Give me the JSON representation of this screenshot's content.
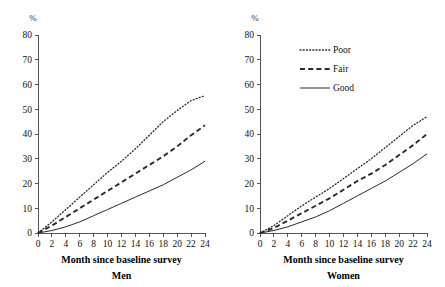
{
  "figure": {
    "width": 445,
    "height": 287,
    "background": "#ffffff",
    "line_color": "#2a2a2a",
    "axis_color": "#555555"
  },
  "legend": {
    "position": "top-right-of-women-panel",
    "entries": [
      {
        "label": "Poor",
        "style": "dotted"
      },
      {
        "label": "Fair",
        "style": "dashed"
      },
      {
        "label": "Good",
        "style": "solid"
      }
    ]
  },
  "chart_data": [
    {
      "type": "line",
      "title": "Men",
      "xlabel": "Month since baseline survey",
      "ylabel": "%",
      "unit": "%",
      "xlim": [
        0,
        24
      ],
      "ylim": [
        0,
        80
      ],
      "xticks": [
        0,
        2,
        4,
        6,
        8,
        10,
        12,
        14,
        16,
        18,
        20,
        22,
        24
      ],
      "yticks": [
        0,
        10,
        20,
        30,
        40,
        50,
        60,
        70,
        80
      ],
      "grid": false,
      "x": [
        0,
        2,
        4,
        6,
        8,
        10,
        12,
        14,
        16,
        18,
        20,
        22,
        24
      ],
      "series": [
        {
          "name": "Poor",
          "style": "dotted",
          "values": [
            0,
            4.5,
            9.5,
            14.5,
            19.5,
            24.5,
            29.0,
            34.0,
            39.5,
            45.0,
            49.5,
            53.5,
            55.5
          ]
        },
        {
          "name": "Fair",
          "style": "dashed",
          "values": [
            0,
            3.0,
            6.5,
            10.0,
            13.5,
            17.0,
            20.5,
            24.0,
            27.5,
            31.0,
            35.0,
            39.5,
            43.5
          ]
        },
        {
          "name": "Good",
          "style": "solid",
          "values": [
            0,
            1.0,
            2.5,
            4.5,
            7.0,
            9.5,
            12.0,
            14.5,
            17.0,
            19.5,
            22.5,
            25.5,
            29.0
          ]
        }
      ]
    },
    {
      "type": "line",
      "title": "Women",
      "xlabel": "Month since baseline survey",
      "ylabel": "%",
      "unit": "%",
      "xlim": [
        0,
        24
      ],
      "ylim": [
        0,
        80
      ],
      "xticks": [
        0,
        2,
        4,
        6,
        8,
        10,
        12,
        14,
        16,
        18,
        20,
        22,
        24
      ],
      "yticks": [
        0,
        10,
        20,
        30,
        40,
        50,
        60,
        70,
        80
      ],
      "grid": false,
      "x": [
        0,
        2,
        4,
        6,
        8,
        10,
        12,
        14,
        16,
        18,
        20,
        22,
        24
      ],
      "series": [
        {
          "name": "Poor",
          "style": "dotted",
          "values": [
            0,
            3.0,
            7.0,
            11.0,
            14.5,
            18.0,
            22.0,
            26.0,
            30.0,
            34.5,
            39.0,
            43.5,
            47.0
          ]
        },
        {
          "name": "Fair",
          "style": "dashed",
          "values": [
            0,
            2.0,
            5.0,
            8.0,
            11.0,
            14.0,
            17.5,
            21.0,
            24.0,
            27.5,
            31.5,
            35.5,
            40.0
          ]
        },
        {
          "name": "Good",
          "style": "solid",
          "values": [
            0,
            1.0,
            2.5,
            4.5,
            6.5,
            9.0,
            12.0,
            15.0,
            18.0,
            21.0,
            24.5,
            28.0,
            32.0
          ]
        }
      ]
    }
  ]
}
